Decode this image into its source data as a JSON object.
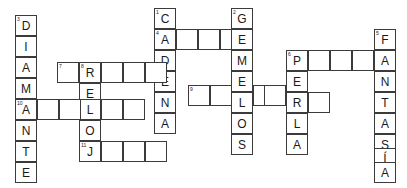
{
  "puzzle": {
    "type": "crossword-grid",
    "title": "",
    "grid": {
      "cell_width": 22,
      "cell_height": 21,
      "border_color": "#3b3b3b",
      "cell_background": "#ffffff",
      "page_background": "#ffffff"
    },
    "entries": [
      {
        "number": "1",
        "direction": "down",
        "answer": "CADENA",
        "start": {
          "x": 154,
          "y": 8
        },
        "letters": [
          "C",
          "A",
          "D",
          "E",
          "N",
          "A"
        ]
      },
      {
        "number": "2",
        "direction": "down",
        "answer": "GEMELOS",
        "start": {
          "x": 231,
          "y": 8
        },
        "letters": [
          "G",
          "E",
          "M",
          "E",
          "L",
          "O",
          "S"
        ]
      },
      {
        "number": "3",
        "direction": "down",
        "answer": "DIAMANTE",
        "start": {
          "x": 15,
          "y": 15
        },
        "letters": [
          "D",
          "I",
          "A",
          "M",
          "A",
          "N",
          "T",
          "E"
        ]
      },
      {
        "number": "4",
        "direction": "across",
        "answer": "A___E",
        "start": {
          "x": 154,
          "y": 29
        },
        "letters": [
          "A",
          "",
          "",
          "",
          "E"
        ]
      },
      {
        "number": "5",
        "direction": "down",
        "answer": "FANTASÍA",
        "start": {
          "x": 374,
          "y": 29
        },
        "letters": [
          "F",
          "A",
          "N",
          "T",
          "A",
          "S",
          "Í",
          "A"
        ]
      },
      {
        "number": "6",
        "direction": "across",
        "answer": "P___F",
        "start": {
          "x": 286,
          "y": 50
        },
        "letters": [
          "P",
          "",
          "",
          "",
          "F"
        ]
      },
      {
        "number": "6",
        "direction": "down",
        "answer": "PERLA",
        "start": {
          "x": 286,
          "y": 50
        },
        "letters": [
          "P",
          "E",
          "R",
          "L",
          "A"
        ]
      },
      {
        "number": "7",
        "direction": "across",
        "answer": "_R___E",
        "start": {
          "x": 57,
          "y": 62
        },
        "letters": [
          "",
          "R",
          "",
          "",
          "",
          "E"
        ]
      },
      {
        "number": "8",
        "direction": "down",
        "answer": "RELOJ",
        "start": {
          "x": 79,
          "y": 62
        },
        "letters": [
          "R",
          "E",
          "L",
          "O",
          "J"
        ]
      },
      {
        "number": "9",
        "direction": "across",
        "answer": "__L__R",
        "start": {
          "x": 188,
          "y": 85
        },
        "letters": [
          "",
          "",
          "L",
          "",
          "",
          "R"
        ]
      },
      {
        "number": "10",
        "direction": "across",
        "answer": "A__L__",
        "start": {
          "x": 15,
          "y": 99
        },
        "letters": [
          "A",
          "",
          "",
          "L",
          "",
          ""
        ]
      },
      {
        "number": "11",
        "direction": "across",
        "answer": "J___",
        "start": {
          "x": 79,
          "y": 141
        },
        "letters": [
          "J",
          "",
          "",
          ""
        ]
      }
    ],
    "cells": [
      {
        "name": "cell-r1c1",
        "x": 154,
        "y": 8,
        "letter": "C",
        "num": "1"
      },
      {
        "name": "cell-r1c2",
        "x": 231,
        "y": 8,
        "letter": "G",
        "num": "2"
      },
      {
        "name": "cell-r2c1",
        "x": 154,
        "y": 29,
        "letter": "A",
        "num": "4"
      },
      {
        "name": "cell-r2c2",
        "x": 176,
        "y": 29,
        "letter": "",
        "num": ""
      },
      {
        "name": "cell-r2c3",
        "x": 198,
        "y": 29,
        "letter": "",
        "num": ""
      },
      {
        "name": "cell-r2c4",
        "x": 220,
        "y": 29,
        "letter": "",
        "num": ""
      },
      {
        "name": "cell-r2c5",
        "x": 231,
        "y": 29,
        "letter": "E",
        "num": ""
      },
      {
        "name": "cell-r2c6",
        "x": 374,
        "y": 29,
        "letter": "F",
        "num": "5"
      },
      {
        "name": "cell-r3c0",
        "x": 15,
        "y": 15,
        "letter": "D",
        "num": "3"
      },
      {
        "name": "cell-r3c1",
        "x": 15,
        "y": 36,
        "letter": "I",
        "num": ""
      },
      {
        "name": "cell-r3c2",
        "x": 15,
        "y": 57,
        "letter": "A",
        "num": ""
      },
      {
        "name": "cell-r3c3",
        "x": 15,
        "y": 78,
        "letter": "M",
        "num": ""
      },
      {
        "name": "cell-r3c4",
        "x": 15,
        "y": 99,
        "letter": "A",
        "num": "10"
      },
      {
        "name": "cell-r3c5",
        "x": 15,
        "y": 120,
        "letter": "N",
        "num": ""
      },
      {
        "name": "cell-r3c6",
        "x": 15,
        "y": 141,
        "letter": "T",
        "num": ""
      },
      {
        "name": "cell-r3c7",
        "x": 15,
        "y": 162,
        "letter": "E",
        "num": ""
      },
      {
        "name": "cell-cadena-d",
        "x": 154,
        "y": 50,
        "letter": "D",
        "num": ""
      },
      {
        "name": "cell-cadena-e",
        "x": 154,
        "y": 71,
        "letter": "E",
        "num": ""
      },
      {
        "name": "cell-cadena-n",
        "x": 154,
        "y": 92,
        "letter": "N",
        "num": ""
      },
      {
        "name": "cell-cadena-a",
        "x": 154,
        "y": 113,
        "letter": "A",
        "num": ""
      },
      {
        "name": "cell-gem-m",
        "x": 231,
        "y": 50,
        "letter": "M",
        "num": ""
      },
      {
        "name": "cell-gem-e2",
        "x": 231,
        "y": 71,
        "letter": "E",
        "num": ""
      },
      {
        "name": "cell-gem-l",
        "x": 231,
        "y": 92,
        "letter": "L",
        "num": ""
      },
      {
        "name": "cell-gem-o",
        "x": 231,
        "y": 113,
        "letter": "O",
        "num": ""
      },
      {
        "name": "cell-gem-s",
        "x": 231,
        "y": 134,
        "letter": "S",
        "num": ""
      },
      {
        "name": "cell-perla-p",
        "x": 286,
        "y": 50,
        "letter": "P",
        "num": "6"
      },
      {
        "name": "cell-perla-x1",
        "x": 308,
        "y": 50,
        "letter": "",
        "num": ""
      },
      {
        "name": "cell-perla-x2",
        "x": 330,
        "y": 50,
        "letter": "",
        "num": ""
      },
      {
        "name": "cell-perla-x3",
        "x": 352,
        "y": 50,
        "letter": "",
        "num": ""
      },
      {
        "name": "cell-perla-e",
        "x": 286,
        "y": 71,
        "letter": "E",
        "num": ""
      },
      {
        "name": "cell-perla-r",
        "x": 286,
        "y": 92,
        "letter": "R",
        "num": ""
      },
      {
        "name": "cell-perla-l",
        "x": 286,
        "y": 113,
        "letter": "L",
        "num": ""
      },
      {
        "name": "cell-perla-a",
        "x": 286,
        "y": 134,
        "letter": "A",
        "num": ""
      },
      {
        "name": "cell-fant-a1",
        "x": 374,
        "y": 50,
        "letter": "A",
        "num": ""
      },
      {
        "name": "cell-fant-n",
        "x": 374,
        "y": 71,
        "letter": "N",
        "num": ""
      },
      {
        "name": "cell-fant-t",
        "x": 374,
        "y": 92,
        "letter": "T",
        "num": ""
      },
      {
        "name": "cell-fant-a2",
        "x": 374,
        "y": 113,
        "letter": "A",
        "num": ""
      },
      {
        "name": "cell-fant-s",
        "x": 374,
        "y": 134,
        "letter": "S",
        "num": ""
      },
      {
        "name": "cell-fant-i",
        "x": 374,
        "y": 148,
        "letter": "Í",
        "num": ""
      },
      {
        "name": "cell-fant-a3",
        "x": 374,
        "y": 162,
        "letter": "A",
        "num": ""
      },
      {
        "name": "cell-r7c0",
        "x": 57,
        "y": 62,
        "letter": "",
        "num": "7"
      },
      {
        "name": "cell-r7c1",
        "x": 79,
        "y": 62,
        "letter": "R",
        "num": "8"
      },
      {
        "name": "cell-r7c2",
        "x": 101,
        "y": 62,
        "letter": "",
        "num": ""
      },
      {
        "name": "cell-r7c3",
        "x": 123,
        "y": 62,
        "letter": "",
        "num": ""
      },
      {
        "name": "cell-r7c4",
        "x": 145,
        "y": 62,
        "letter": "",
        "num": ""
      },
      {
        "name": "cell-reloj-e",
        "x": 79,
        "y": 83,
        "letter": "E",
        "num": ""
      },
      {
        "name": "cell-reloj-l",
        "x": 79,
        "y": 99,
        "letter": "L",
        "num": ""
      },
      {
        "name": "cell-reloj-o",
        "x": 79,
        "y": 120,
        "letter": "O",
        "num": ""
      },
      {
        "name": "cell-reloj-j",
        "x": 79,
        "y": 141,
        "letter": "J",
        "num": "11"
      },
      {
        "name": "cell-r10c1",
        "x": 37,
        "y": 99,
        "letter": "",
        "num": ""
      },
      {
        "name": "cell-r10c2",
        "x": 59,
        "y": 99,
        "letter": "",
        "num": ""
      },
      {
        "name": "cell-r10c4",
        "x": 101,
        "y": 99,
        "letter": "",
        "num": ""
      },
      {
        "name": "cell-r10c5",
        "x": 123,
        "y": 99,
        "letter": "",
        "num": ""
      },
      {
        "name": "cell-r11c1",
        "x": 101,
        "y": 141,
        "letter": "",
        "num": ""
      },
      {
        "name": "cell-r11c2",
        "x": 123,
        "y": 141,
        "letter": "",
        "num": ""
      },
      {
        "name": "cell-r11c3",
        "x": 145,
        "y": 141,
        "letter": "",
        "num": ""
      },
      {
        "name": "cell-r9c0",
        "x": 188,
        "y": 85,
        "letter": "",
        "num": "9"
      },
      {
        "name": "cell-r9c1",
        "x": 210,
        "y": 85,
        "letter": "",
        "num": ""
      },
      {
        "name": "cell-r9c3",
        "x": 253,
        "y": 85,
        "letter": "",
        "num": ""
      },
      {
        "name": "cell-r9c4",
        "x": 264,
        "y": 85,
        "letter": "",
        "num": ""
      },
      {
        "name": "cell-r9c6",
        "x": 308,
        "y": 92,
        "letter": "",
        "num": ""
      }
    ]
  }
}
